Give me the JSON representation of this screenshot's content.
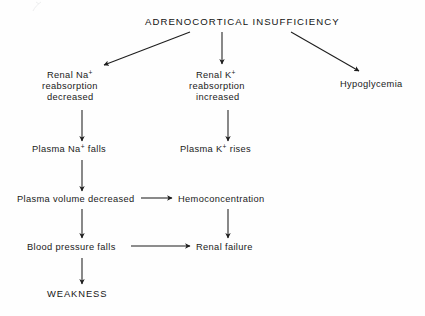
{
  "diagram": {
    "title": "ADRENOCORTICAL   INSUFFICIENCY",
    "type": "flowchart",
    "title_words": {
      "word1": "ADRENOCORTICAL",
      "word2": "INSUFFICIENCY"
    },
    "nodes": {
      "root": {
        "id": "adrenocortical-insufficiency",
        "label": "ADRENOCORTICAL   INSUFFICIENCY"
      },
      "renal_na": {
        "id": "renal-na-reabsorption-decreased",
        "line1_pre": "Renal Na",
        "line1_sup": "+",
        "line2": "reabsorption",
        "line3": "decreased"
      },
      "renal_k": {
        "id": "renal-k-reabsorption-increased",
        "line1_pre": "Renal K",
        "line1_sup": "+",
        "line2": "reabsorption",
        "line3": "increased"
      },
      "hypoglycemia": {
        "id": "hypoglycemia",
        "label": "Hypoglycemia"
      },
      "plasma_na_falls": {
        "id": "plasma-na-falls",
        "pre": "Plasma Na",
        "sup": "+",
        "post": " falls"
      },
      "plasma_k_rises": {
        "id": "plasma-k-rises",
        "pre": "Plasma K",
        "sup": "+",
        "post": " rises"
      },
      "plasma_volume": {
        "id": "plasma-volume-decreased",
        "label": "Plasma volume decreased"
      },
      "hemoconcentration": {
        "id": "hemoconcentration",
        "label": "Hemoconcentration"
      },
      "blood_pressure": {
        "id": "blood-pressure-falls",
        "label": "Blood pressure falls"
      },
      "renal_failure": {
        "id": "renal-failure",
        "label": "Renal failure"
      },
      "weakness": {
        "id": "weakness",
        "label": "WEAKNESS"
      }
    },
    "edges": [
      {
        "from": "adrenocortical-insufficiency",
        "to": "renal-na-reabsorption-decreased",
        "style": "diagonal-left"
      },
      {
        "from": "adrenocortical-insufficiency",
        "to": "renal-k-reabsorption-increased",
        "style": "vertical"
      },
      {
        "from": "adrenocortical-insufficiency",
        "to": "hypoglycemia",
        "style": "diagonal-right"
      },
      {
        "from": "renal-na-reabsorption-decreased",
        "to": "plasma-na-falls",
        "style": "vertical"
      },
      {
        "from": "renal-k-reabsorption-increased",
        "to": "plasma-k-rises",
        "style": "vertical"
      },
      {
        "from": "plasma-na-falls",
        "to": "plasma-volume-decreased",
        "style": "vertical"
      },
      {
        "from": "plasma-volume-decreased",
        "to": "hemoconcentration",
        "style": "horizontal"
      },
      {
        "from": "plasma-volume-decreased",
        "to": "blood-pressure-falls",
        "style": "vertical"
      },
      {
        "from": "hemoconcentration",
        "to": "renal-failure",
        "style": "vertical"
      },
      {
        "from": "blood-pressure-falls",
        "to": "renal-failure",
        "style": "horizontal"
      },
      {
        "from": "blood-pressure-falls",
        "to": "weakness",
        "style": "vertical"
      }
    ],
    "colors": {
      "background": "#fefefe",
      "text": "#1a1a1a",
      "line": "#1d1d1d"
    }
  }
}
